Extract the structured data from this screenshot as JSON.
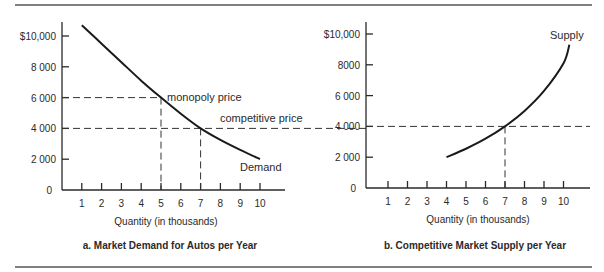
{
  "chart_data": [
    {
      "type": "line",
      "id": "panel_a",
      "title": "a. Market Demand for Autos per Year",
      "xlabel": "Quantity (in thousands)",
      "ylabel": "",
      "xlim": [
        0,
        11.2
      ],
      "ylim": [
        0,
        11000
      ],
      "x_ticks": [
        1,
        2,
        3,
        4,
        5,
        6,
        7,
        8,
        9,
        10
      ],
      "x_tick_labels": [
        "1",
        "2",
        "3",
        "4",
        "5",
        "6",
        "7",
        "8",
        "9",
        "10"
      ],
      "y_ticks": [
        0,
        2000,
        4000,
        6000,
        8000,
        10000
      ],
      "y_tick_labels": [
        "0",
        "2 000",
        "4 000",
        "6 000",
        "8 000",
        "$10,000"
      ],
      "grid": false,
      "series": [
        {
          "name": "Demand",
          "x": [
            1,
            2,
            3,
            4,
            5,
            6,
            7,
            8,
            9,
            10
          ],
          "values": [
            10700,
            9500,
            8300,
            7100,
            6000,
            4950,
            4000,
            3250,
            2600,
            2000
          ]
        }
      ],
      "reference_lines": [
        {
          "label": "monopoly price",
          "y": 6000,
          "x": 5
        },
        {
          "label": "competitive price",
          "y": 4000,
          "x": 7
        }
      ],
      "annotations": [
        "monopoly price",
        "competitive price",
        "Demand"
      ]
    },
    {
      "type": "line",
      "id": "panel_b",
      "title": "b. Competitive Market Supply per Year",
      "xlabel": "Quantity (in thousands)",
      "ylabel": "",
      "xlim": [
        0,
        11.2
      ],
      "ylim": [
        0,
        11000
      ],
      "x_ticks": [
        1,
        2,
        3,
        4,
        5,
        6,
        7,
        8,
        9,
        10
      ],
      "x_tick_labels": [
        "1",
        "2",
        "3",
        "4",
        "5",
        "6",
        "7",
        "8",
        "9",
        "10"
      ],
      "y_ticks": [
        0,
        2000,
        4000,
        6000,
        8000,
        10000
      ],
      "y_tick_labels": [
        "0",
        "2 000",
        "4 000",
        "6 000",
        "8000",
        "$10,000"
      ],
      "grid": false,
      "series": [
        {
          "name": "Supply",
          "x": [
            4,
            5,
            6,
            7,
            8,
            9,
            10,
            10.3
          ],
          "values": [
            2000,
            2550,
            3200,
            4000,
            5000,
            6300,
            8100,
            9300
          ]
        }
      ],
      "reference_lines": [
        {
          "label": "competitive price",
          "y": 4000,
          "x": 7
        }
      ],
      "annotations": [
        "Supply"
      ]
    }
  ],
  "labels": {
    "monopoly_price": "monopoly price",
    "competitive_price": "competitive price",
    "demand": "Demand",
    "supply": "Supply"
  },
  "colors": {
    "ink": "#2a2a2a",
    "rule": "#555555",
    "background": "#ffffff"
  }
}
